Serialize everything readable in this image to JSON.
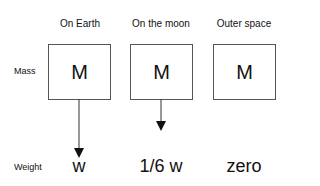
{
  "columns": [
    {
      "label": "On Earth",
      "symbol": "M",
      "weight": "w"
    },
    {
      "label": "On the moon",
      "symbol": "M",
      "weight": "1/6 w"
    },
    {
      "label": "Outer space",
      "symbol": "M",
      "weight": "zero"
    }
  ],
  "rows": {
    "mass_label": "Mass",
    "weight_label": "Weight"
  }
}
